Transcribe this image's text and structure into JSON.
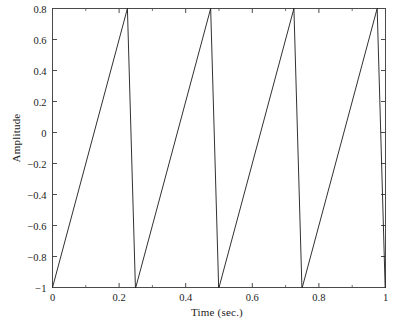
{
  "chart_data": {
    "type": "line",
    "title": "",
    "subtitle": "",
    "xlabel": "Time (sec.)",
    "ylabel": "Amplitude",
    "xlim": [
      0,
      1
    ],
    "ylim": [
      -1,
      0.8
    ],
    "xticks": [
      0,
      0.2,
      0.4,
      0.6,
      0.8,
      1
    ],
    "xticklabels": [
      "0",
      "0.2",
      "0.4",
      "0.6",
      "0.8",
      "1"
    ],
    "yticks": [
      -1,
      -0.8,
      -0.6,
      -0.4,
      -0.2,
      0,
      0.2,
      0.4,
      0.6,
      0.8
    ],
    "yticklabels": [
      "−1",
      "−0.8",
      "−0.6",
      "−0.4",
      "−0.2",
      "0",
      "0.2",
      "0.4",
      "0.6",
      "0.8"
    ],
    "grid": false,
    "legend": null,
    "annotations": [],
    "series": [
      {
        "name": "sawtooth",
        "color": "#1a1a1a",
        "linewidth": 0.9,
        "description": "Sawtooth wave, period 0.25 s, rises linearly from -1 to 0.8 then falls steeply back to -1",
        "x": [
          0,
          0.225,
          0.249,
          0.25,
          0.475,
          0.499,
          0.5,
          0.725,
          0.749,
          0.75,
          0.975,
          0.999,
          1.0
        ],
        "y": [
          -1,
          0.8,
          -1,
          -1,
          0.8,
          -1,
          -1,
          0.8,
          -1,
          -1,
          0.8,
          -1,
          -1
        ]
      }
    ],
    "axes_color": "#4a4a4a",
    "background": "#ffffff",
    "period_sec": 0.25,
    "peak_amplitude": 0.8,
    "trough_amplitude": -1
  }
}
